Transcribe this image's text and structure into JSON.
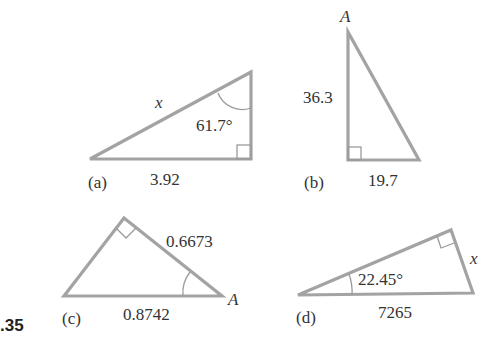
{
  "problem_number": ".35",
  "triangles": [
    {
      "id": "a",
      "part_label": "(a)",
      "hypotenuse_label": "x",
      "angle_label": "61.7°",
      "base_label": "3.92",
      "right_angle": true
    },
    {
      "id": "b",
      "part_label": "(b)",
      "vertex_label": "A",
      "vertical_side_label": "36.3",
      "base_label": "19.7",
      "right_angle": true
    },
    {
      "id": "c",
      "part_label": "(c)",
      "side_label": "0.6673",
      "base_label": "0.8742",
      "vertex_label": "A",
      "right_angle": true
    },
    {
      "id": "d",
      "part_label": "(d)",
      "angle_label": "22.45°",
      "base_label": "7265",
      "side_label": "x",
      "right_angle": true
    }
  ]
}
